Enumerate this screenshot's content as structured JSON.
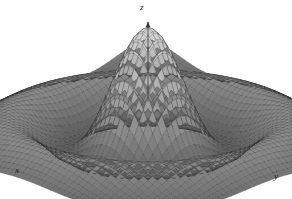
{
  "figure": {
    "title": "",
    "background_color": "#fefefe",
    "mesh_color": "#262626",
    "surface_light": "#d8d8d8",
    "surface_dark": "#4a4a4a",
    "axis_color": "#3a3a3a"
  },
  "axes": {
    "x_label": "x",
    "y_label": "y",
    "z_label": "z"
  },
  "chart_data": {
    "type": "surface",
    "title": "",
    "xlabel": "x",
    "ylabel": "y",
    "zlabel": "z",
    "function": "sin(r)/r",
    "grid": true,
    "legend": "none",
    "xlim": [
      -10,
      10
    ],
    "ylim": [
      -10,
      10
    ],
    "zlim": [
      -0.25,
      1
    ],
    "nx": 56,
    "ny": 56,
    "projection": {
      "azimuth_deg": 45,
      "elevation_deg": 22,
      "origin_px": [
        148,
        130
      ],
      "x_axis_px": [
        -130,
        42
      ],
      "y_axis_px": [
        130,
        42
      ],
      "z_axis_px": [
        0,
        -102
      ]
    },
    "peak": {
      "x": 0,
      "y": 0,
      "z": 1.0,
      "screen_px": [
        148,
        29
      ]
    },
    "rings": [
      {
        "radius": 4.49,
        "z": -0.217
      },
      {
        "radius": 7.73,
        "z": 0.128
      },
      {
        "radius": 10.9,
        "z": -0.091
      }
    ],
    "colorscale": [
      "#4a4a4a",
      "#9a9a9a",
      "#d8d8d8"
    ]
  }
}
